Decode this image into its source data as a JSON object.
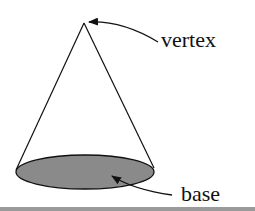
{
  "diagram": {
    "labels": {
      "vertex": "vertex",
      "base": "base"
    },
    "colors": {
      "stroke": "#111111",
      "base_fill": "#8a8a8a",
      "background": "#ffffff",
      "bottom_strip": "#9a9a9a"
    }
  }
}
